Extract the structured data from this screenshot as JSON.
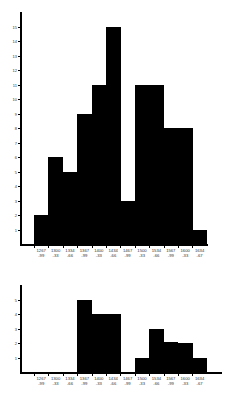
{
  "chart_data": [
    {
      "type": "bar",
      "title": "",
      "xlabel": "",
      "ylabel": "",
      "categories": [
        "1267-99",
        "1300-33",
        "1334-66",
        "1367-99",
        "1400-33",
        "1434-66",
        "1467-99",
        "1500-33",
        "1534-66",
        "1567-99",
        "1600-33",
        "1634-67"
      ],
      "category_lines": [
        [
          "1267",
          "-99"
        ],
        [
          "1300",
          "-33"
        ],
        [
          "1334",
          "-66"
        ],
        [
          "1367",
          "-99"
        ],
        [
          "1400",
          "-33"
        ],
        [
          "1434",
          "-66"
        ],
        [
          "1467",
          "-99"
        ],
        [
          "1500",
          "-33"
        ],
        [
          "1534",
          "-66"
        ],
        [
          "1567",
          "-99"
        ],
        [
          "1600",
          "-33"
        ],
        [
          "1634",
          "-67"
        ]
      ],
      "values": [
        2,
        6,
        5,
        9,
        11,
        15,
        3,
        11,
        11,
        8,
        8,
        1
      ],
      "yticks": [
        1,
        2,
        3,
        4,
        5,
        6,
        7,
        8,
        9,
        10,
        11,
        12,
        13,
        14,
        15
      ],
      "ylim": [
        0,
        16
      ],
      "grid": false,
      "bar_color": "#000000"
    },
    {
      "type": "bar",
      "title": "",
      "xlabel": "",
      "ylabel": "",
      "categories": [
        "1267-99",
        "1300-33",
        "1334-66",
        "1367-99",
        "1400-33",
        "1434-66",
        "1467-99",
        "1500-33",
        "1534-66",
        "1567-99",
        "1600-33",
        "1634-67"
      ],
      "category_lines": [
        [
          "1267",
          "-99"
        ],
        [
          "1300",
          "-33"
        ],
        [
          "1334",
          "-66"
        ],
        [
          "1367",
          "-99"
        ],
        [
          "1400",
          "-33"
        ],
        [
          "1434",
          "-66"
        ],
        [
          "1467",
          "-99"
        ],
        [
          "1500",
          "-33"
        ],
        [
          "1534",
          "-66"
        ],
        [
          "1567",
          "-99"
        ],
        [
          "1600",
          "-33"
        ],
        [
          "1634",
          "-67"
        ]
      ],
      "values": [
        0,
        0,
        0,
        5,
        4,
        4,
        0,
        1,
        3,
        2.1,
        2,
        1
      ],
      "yticks": [
        1,
        2,
        3,
        4,
        5
      ],
      "ylim": [
        0,
        6
      ],
      "grid": false,
      "bar_color": "#000000"
    }
  ]
}
